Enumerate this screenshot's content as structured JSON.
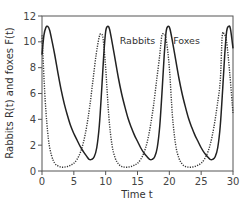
{
  "chart_data": {
    "type": "line",
    "title": "",
    "xlabel": "Time t",
    "ylabel": "Rabbits R(t) and foxes F(t)",
    "xlim": [
      0,
      30
    ],
    "ylim": [
      0,
      12
    ],
    "xticks": [
      0,
      5,
      10,
      15,
      20,
      25,
      30
    ],
    "yticks": [
      0,
      2,
      4,
      6,
      8,
      10,
      12
    ],
    "xtick_labels": [
      "0",
      "5",
      "10",
      "15",
      "20",
      "25",
      "30"
    ],
    "ytick_labels": [
      "0",
      "2",
      "4",
      "6",
      "8",
      "10",
      "12"
    ],
    "grid": false,
    "legend_position": "inline annotations near third peak",
    "series": [
      {
        "name": "Rabbits",
        "style": "dotted",
        "color": "#333333",
        "x": [
          0,
          0.5,
          1,
          1.5,
          2,
          2.5,
          3,
          3.5,
          4,
          4.5,
          5,
          5.5,
          6,
          6.5,
          7,
          7.5,
          8,
          8.5,
          9,
          9.3,
          9.6,
          10,
          10.5,
          11,
          11.5,
          12,
          12.5,
          13,
          13.5,
          14,
          14.5,
          15,
          15.5,
          16,
          16.5,
          17,
          17.5,
          18,
          18.5,
          18.8,
          19.1,
          19.5,
          20,
          20.5,
          21,
          21.5,
          22,
          22.5,
          23,
          23.5,
          24,
          24.5,
          25,
          25.5,
          26,
          26.5,
          27,
          27.5,
          28,
          28.3,
          28.6,
          29,
          29.5,
          30
        ],
        "values": [
          10.5,
          5.5,
          2.5,
          1.2,
          0.6,
          0.4,
          0.3,
          0.3,
          0.35,
          0.45,
          0.6,
          0.9,
          1.4,
          2.2,
          3.4,
          5.0,
          7.0,
          9.0,
          10.4,
          10.6,
          10.2,
          8.0,
          4.2,
          2.0,
          1.0,
          0.55,
          0.35,
          0.3,
          0.3,
          0.35,
          0.45,
          0.6,
          0.9,
          1.4,
          2.2,
          3.4,
          5.0,
          7.0,
          9.0,
          10.4,
          10.6,
          10.2,
          8.0,
          4.2,
          2.0,
          1.0,
          0.55,
          0.35,
          0.3,
          0.3,
          0.35,
          0.45,
          0.6,
          0.9,
          1.4,
          2.2,
          3.4,
          5.0,
          7.0,
          10.4,
          10.6,
          10.0,
          7.5,
          4.5
        ]
      },
      {
        "name": "Foxes",
        "style": "solid",
        "color": "#222222",
        "x": [
          0,
          0.3,
          0.6,
          0.9,
          1.2,
          1.6,
          2,
          2.5,
          3,
          3.5,
          4,
          4.5,
          5,
          5.5,
          6,
          6.5,
          7,
          7.4,
          7.8,
          8.2,
          8.6,
          9,
          9.4,
          9.7,
          10,
          10.3,
          10.6,
          11,
          11.5,
          12,
          12.5,
          13,
          13.5,
          14,
          14.5,
          15,
          15.5,
          16,
          16.5,
          16.9,
          17.3,
          17.7,
          18.1,
          18.5,
          18.9,
          19.2,
          19.5,
          19.8,
          20.1,
          20.5,
          21,
          21.5,
          22,
          22.5,
          23,
          23.5,
          24,
          24.5,
          25,
          25.5,
          26,
          26.4,
          26.8,
          27.2,
          27.6,
          28,
          28.4,
          28.7,
          29,
          29.3,
          29.6,
          30
        ],
        "values": [
          9.0,
          10.5,
          11.1,
          11.2,
          10.9,
          10.0,
          9.0,
          7.6,
          6.3,
          5.2,
          4.3,
          3.5,
          2.9,
          2.4,
          1.9,
          1.5,
          1.15,
          0.9,
          0.9,
          1.1,
          1.8,
          3.5,
          6.5,
          9.0,
          10.8,
          11.2,
          11.0,
          10.0,
          8.6,
          7.2,
          6.0,
          5.0,
          4.1,
          3.4,
          2.8,
          2.3,
          1.8,
          1.4,
          1.1,
          0.9,
          0.9,
          1.1,
          1.8,
          3.5,
          6.5,
          9.0,
          10.8,
          11.2,
          11.0,
          10.0,
          8.6,
          7.2,
          6.0,
          5.0,
          4.1,
          3.4,
          2.8,
          2.3,
          1.8,
          1.4,
          1.1,
          0.9,
          0.9,
          1.1,
          1.8,
          3.5,
          6.5,
          9.0,
          10.8,
          11.2,
          11.0,
          9.5
        ]
      }
    ],
    "annotations": [
      {
        "text": "Rabbits",
        "x": 15.0,
        "y": 9.8
      },
      {
        "text": "Foxes",
        "x": 22.7,
        "y": 9.8
      }
    ]
  }
}
